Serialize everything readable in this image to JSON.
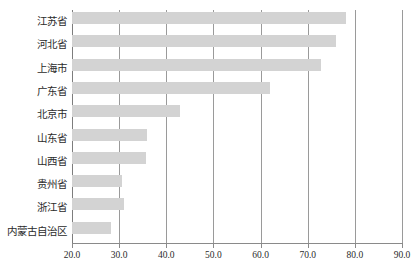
{
  "chart_data": {
    "type": "bar",
    "orientation": "horizontal",
    "title": "",
    "xlabel": "",
    "ylabel": "",
    "xlim": [
      20.0,
      90.0
    ],
    "xticks": [
      "20.0",
      "30.0",
      "40.0",
      "50.0",
      "60.0",
      "70.0",
      "80.0",
      "90.0"
    ],
    "xtick_values": [
      20.0,
      30.0,
      40.0,
      50.0,
      60.0,
      70.0,
      80.0,
      90.0
    ],
    "grid": "vertical",
    "legend": "none",
    "bar_color": "#d3d3d3",
    "gridline_color": "#9a9a9a",
    "axis_color": "#8a8a8a",
    "categories": [
      "江苏省",
      "河北省",
      "上海市",
      "广东省",
      "北京市",
      "山东省",
      "山西省",
      "贵州省",
      "浙江省",
      "内蒙古自治区"
    ],
    "values": [
      78.1,
      75.9,
      72.8,
      62.1,
      43.0,
      35.9,
      35.7,
      30.6,
      31.1,
      28.3
    ]
  }
}
